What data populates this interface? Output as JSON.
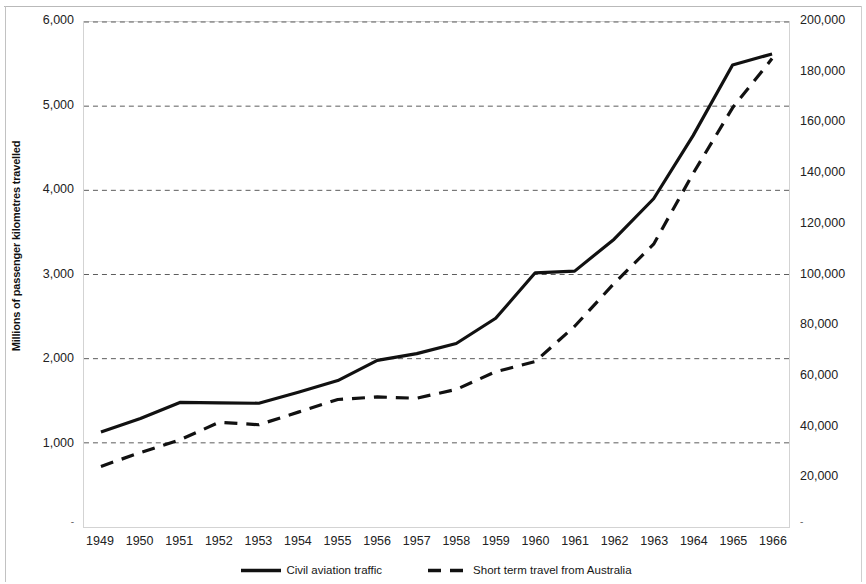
{
  "chart_data": {
    "type": "line",
    "title": "",
    "xlabel": "",
    "ylabel": "Millions of passenger kilometres travelled",
    "y2label": "Number of Australian residents departing",
    "grid": true,
    "legend_position": "bottom",
    "categories": [
      "1949",
      "1950",
      "1951",
      "1952",
      "1953",
      "1954",
      "1955",
      "1956",
      "1957",
      "1958",
      "1959",
      "1960",
      "1961",
      "1962",
      "1963",
      "1964",
      "1965",
      "1966"
    ],
    "ylim": [
      0,
      6000
    ],
    "yticks": [
      1000,
      2000,
      3000,
      4000,
      5000,
      6000
    ],
    "ytick_labels": [
      "1,000",
      "2,000",
      "3,000",
      "4,000",
      "5,000",
      "6,000"
    ],
    "y2lim": [
      0,
      200000
    ],
    "y2ticks": [
      20000,
      40000,
      60000,
      80000,
      100000,
      120000,
      140000,
      160000,
      180000,
      200000
    ],
    "y2tick_labels": [
      "20,000",
      "40,000",
      "60,000",
      "80,000",
      "100,000",
      "120,000",
      "140,000",
      "160,000",
      "180,000",
      "200,000"
    ],
    "series": [
      {
        "name": "Civil aviation traffic",
        "axis": "left",
        "style": "solid",
        "color": "#111111",
        "values": [
          1130,
          1290,
          1480,
          1475,
          1470,
          1600,
          1740,
          1980,
          2060,
          2180,
          2480,
          3020,
          3040,
          3420,
          3900,
          4650,
          5490,
          5620
        ]
      },
      {
        "name": "Short term travel from Australia",
        "axis": "right",
        "style": "dashed",
        "color": "#111111",
        "values": [
          24000,
          29500,
          34500,
          41500,
          40500,
          45500,
          50500,
          51500,
          51000,
          54500,
          61500,
          65500,
          79500,
          96500,
          112000,
          140000,
          166000,
          185500
        ]
      }
    ]
  },
  "legend": {
    "items": [
      {
        "label": "Civil aviation traffic",
        "style": "solid"
      },
      {
        "label": "Short term travel from Australia",
        "style": "dashed"
      }
    ]
  }
}
